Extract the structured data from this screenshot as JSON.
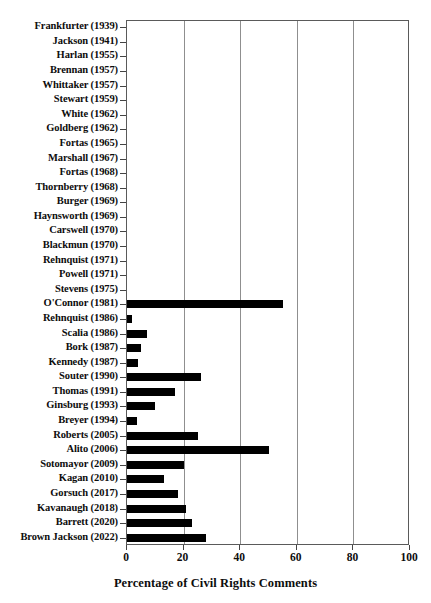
{
  "chart_data": {
    "type": "bar",
    "orientation": "horizontal",
    "title": "",
    "xlabel": "Percentage of Civil Rights Comments",
    "ylabel": "",
    "xlim": [
      0,
      100
    ],
    "xticks": [
      0,
      20,
      40,
      60,
      80,
      100
    ],
    "grid": true,
    "grid_axis": "x",
    "legend": null,
    "bar_color": "#000000",
    "categories": [
      "Frankfurter (1939)",
      "Jackson (1941)",
      "Harlan (1955)",
      "Brennan (1957)",
      "Whittaker (1957)",
      "Stewart (1959)",
      "White (1962)",
      "Goldberg (1962)",
      "Fortas (1965)",
      "Marshall (1967)",
      "Fortas (1968)",
      "Thornberry (1968)",
      "Burger (1969)",
      "Haynsworth (1969)",
      "Carswell (1970)",
      "Blackmun (1970)",
      "Rehnquist (1971)",
      "Powell (1971)",
      "Stevens (1975)",
      "O'Connor (1981)",
      "Rehnquist (1986)",
      "Scalia (1986)",
      "Bork (1987)",
      "Kennedy (1987)",
      "Souter (1990)",
      "Thomas (1991)",
      "Ginsburg (1993)",
      "Breyer (1994)",
      "Roberts (2005)",
      "Alito (2006)",
      "Sotomayor (2009)",
      "Kagan (2010)",
      "Gorsuch (2017)",
      "Kavanaugh (2018)",
      "Barrett (2020)",
      "Brown Jackson (2022)"
    ],
    "values": [
      0,
      0,
      0,
      0,
      0,
      0,
      0,
      0,
      0,
      0,
      0,
      0,
      0,
      0,
      0,
      0,
      0,
      0,
      0,
      55,
      1.8,
      7,
      5,
      4,
      26,
      17,
      10,
      3.5,
      25,
      50,
      20,
      13,
      18,
      21,
      23,
      28
    ]
  }
}
